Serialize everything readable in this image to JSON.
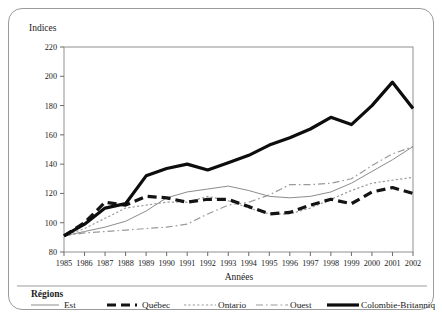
{
  "chart_data": {
    "type": "line",
    "title": "",
    "xlabel": "Années",
    "ylabel": "Indices",
    "ylim": [
      80,
      220
    ],
    "ytick_step": 20,
    "yticks": [
      80,
      100,
      120,
      140,
      160,
      180,
      200,
      220
    ],
    "grid": false,
    "legend_position": "bottom",
    "legend_title": "Régions",
    "x": [
      1985,
      1986,
      1987,
      1988,
      1989,
      1990,
      1991,
      1992,
      1993,
      1994,
      1995,
      1996,
      1997,
      1998,
      1999,
      2000,
      2001,
      2002
    ],
    "categories": [
      "1985",
      "1986",
      "1987",
      "1988",
      "1989",
      "1990",
      "1991",
      "1992",
      "1993",
      "1994",
      "1995",
      "1996",
      "1997",
      "1998",
      "1999",
      "2000",
      "2001",
      "2002"
    ],
    "series": [
      {
        "name": "Est",
        "style": "solid-thin",
        "color": "#8c8c8c",
        "width": 1,
        "values": [
          91,
          94,
          97,
          101,
          108,
          117,
          121,
          123,
          125,
          122,
          118,
          117,
          118,
          121,
          127,
          135,
          143,
          152
        ]
      },
      {
        "name": "Québec",
        "style": "dashed-thick",
        "color": "#141414",
        "width": 3.2,
        "values": [
          91,
          100,
          114,
          112,
          118,
          117,
          114,
          116,
          116,
          111,
          106,
          107,
          112,
          116,
          113,
          121,
          124,
          120
        ]
      },
      {
        "name": "Ontario",
        "style": "dotted",
        "color": "#9a9a9a",
        "width": 1.2,
        "values": [
          91,
          96,
          103,
          110,
          112,
          114,
          114,
          118,
          115,
          110,
          106,
          106,
          110,
          116,
          122,
          127,
          129,
          131
        ]
      },
      {
        "name": "Ouest",
        "style": "dash-dot",
        "color": "#9a9a9a",
        "width": 1.2,
        "values": [
          91,
          93,
          94,
          95,
          96,
          97,
          99,
          106,
          112,
          114,
          119,
          126,
          126,
          127,
          130,
          139,
          147,
          152
        ]
      },
      {
        "name": "Colombie-Britannique",
        "style": "solid-thick",
        "color": "#0d0d0d",
        "width": 3.2,
        "values": [
          91,
          99,
          110,
          113,
          132,
          137,
          140,
          136,
          141,
          146,
          153,
          158,
          164,
          172,
          167,
          180,
          196,
          178
        ]
      }
    ]
  },
  "axes": {
    "y_axis_label": "Indices",
    "x_axis_label": "Années"
  },
  "legend": {
    "title": "Régions",
    "items": [
      {
        "label": "Est",
        "swatch": "solid-thin-line-swatch"
      },
      {
        "label": "Québec",
        "swatch": "dashed-thick-line-swatch"
      },
      {
        "label": "Ontario",
        "swatch": "dotted-line-swatch"
      },
      {
        "label": "Ouest",
        "swatch": "dash-dot-line-swatch"
      },
      {
        "label": "Colombie-Britannique",
        "swatch": "solid-thick-line-swatch"
      }
    ]
  }
}
